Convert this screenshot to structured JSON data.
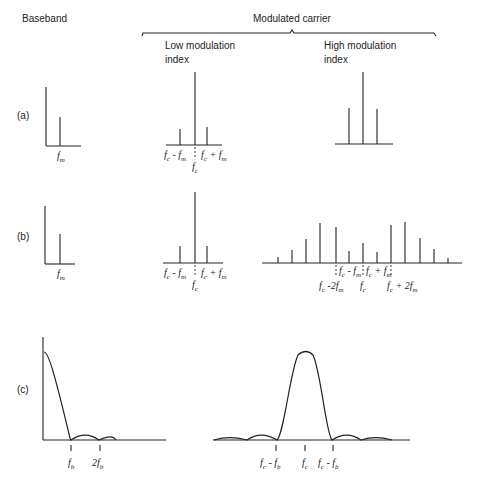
{
  "headers": {
    "baseband": "Baseband",
    "modulated_carrier": "Modulated carrier",
    "low_index": [
      "Low modulation",
      "index"
    ],
    "high_index": [
      "High modulation",
      "index"
    ]
  },
  "row_labels": {
    "a": "(a)",
    "b": "(b)",
    "c": "(c)"
  },
  "colors": {
    "ink": "#222222",
    "background": "#ffffff"
  },
  "chart_data": [
    {
      "id": "a-baseband",
      "type": "bar",
      "title": "(a) Baseband",
      "categories": [
        "f_m"
      ],
      "values": [
        29
      ],
      "axis_height": 59,
      "labels": [
        "f_m"
      ]
    },
    {
      "id": "a-low",
      "type": "bar",
      "title": "(a) Low modulation index",
      "categories": [
        "f_c - f_m",
        "f_c",
        "f_c + f_m"
      ],
      "values": [
        16,
        73,
        18
      ],
      "labels": [
        "f_c - f_m",
        "f_c",
        "f_c + f_m"
      ]
    },
    {
      "id": "a-high",
      "type": "bar",
      "title": "(a) High modulation index",
      "categories": [
        "f_c - f_m",
        "f_c",
        "f_c + f_m"
      ],
      "values": [
        36,
        72,
        35
      ],
      "labels": []
    },
    {
      "id": "b-baseband",
      "type": "bar",
      "title": "(b) Baseband",
      "categories": [
        "f_m"
      ],
      "values": [
        30
      ],
      "axis_height": 58,
      "labels": [
        "f_m"
      ]
    },
    {
      "id": "b-low",
      "type": "bar",
      "title": "(b) Low modulation index",
      "categories": [
        "f_c - f_m",
        "f_c",
        "f_c + f_m"
      ],
      "values": [
        17,
        71,
        17
      ],
      "labels": [
        "f_c - f_m",
        "f_c",
        "f_c + f_m"
      ]
    },
    {
      "id": "b-high",
      "type": "bar",
      "title": "(b) High modulation index",
      "categories": [
        "f_c-6f_m",
        "f_c-5f_m",
        "f_c-4f_m",
        "f_c-3f_m",
        "f_c-2f_m",
        "f_c-f_m",
        "f_c",
        "f_c+f_m",
        "f_c+2f_m",
        "f_c+3f_m",
        "f_c+4f_m",
        "f_c+5f_m",
        "f_c+6f_m"
      ],
      "values": [
        6,
        13,
        24,
        40,
        36,
        12,
        20,
        11,
        38,
        41,
        25,
        14,
        5
      ],
      "labels": [
        "f_c - f_m",
        "f_c + f_m",
        "f_c - 2f_m",
        "f_c",
        "f_c + 2f_m"
      ]
    },
    {
      "id": "c-baseband",
      "type": "line",
      "title": "(c) Baseband (sinc-shaped spectrum)",
      "x": [
        0,
        1,
        1.5,
        2,
        2.5,
        3
      ],
      "values": [
        88,
        0,
        6,
        0,
        4,
        0
      ],
      "tick_labels": [
        "f_b",
        "2f_b"
      ]
    },
    {
      "id": "c-modulated",
      "type": "line",
      "title": "(c) Modulated carrier spectrum",
      "x": [
        -3,
        -2.5,
        -2,
        -1.5,
        -1,
        0,
        1,
        1.5,
        2,
        2.5,
        3
      ],
      "values": [
        0,
        3,
        0,
        6,
        0,
        88,
        0,
        6,
        0,
        3,
        0
      ],
      "tick_labels": [
        "f_c - f_b",
        "f_c",
        "f_c - f_b"
      ]
    }
  ],
  "axis_labels": {
    "fm": "f",
    "fm_sub": "m",
    "fc": "f",
    "fc_sub": "c",
    "fb_sub": "b",
    "minus": "-",
    "plus": "+",
    "two": "2"
  }
}
